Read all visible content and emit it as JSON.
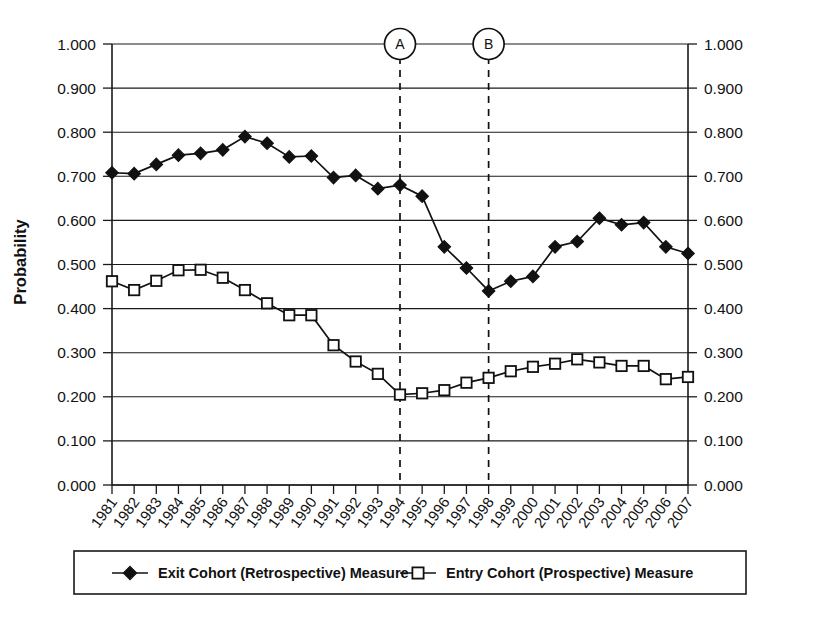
{
  "chart_data": {
    "type": "line",
    "title": "",
    "xlabel": "",
    "ylabel": "Probability",
    "ylim": [
      0.0,
      1.0
    ],
    "ytick_step": 0.1,
    "grid": true,
    "legend_position": "bottom",
    "dual_y_axis": true,
    "x": [
      1981,
      1982,
      1983,
      1984,
      1985,
      1986,
      1987,
      1988,
      1989,
      1990,
      1991,
      1992,
      1993,
      1994,
      1995,
      1996,
      1997,
      1998,
      1999,
      2000,
      2001,
      2002,
      2003,
      2004,
      2005,
      2006,
      2007
    ],
    "categories": [
      "1981",
      "1982",
      "1983",
      "1984",
      "1985",
      "1986",
      "1987",
      "1988",
      "1989",
      "1990",
      "1991",
      "1992",
      "1993",
      "1994",
      "1995",
      "1996",
      "1997",
      "1998",
      "1999",
      "2000",
      "2001",
      "2002",
      "2003",
      "2004",
      "2005",
      "2006",
      "2007"
    ],
    "ytick_labels": [
      "1.000",
      "0.900",
      "0.800",
      "0.700",
      "0.600",
      "0.500",
      "0.400",
      "0.300",
      "0.200",
      "0.100",
      "0.000"
    ],
    "ytick_values": [
      1.0,
      0.9,
      0.8,
      0.7,
      0.6,
      0.5,
      0.4,
      0.3,
      0.2,
      0.1,
      0.0
    ],
    "series": [
      {
        "name": "Exit Cohort (Retrospective) Measure",
        "marker": "filled-diamond",
        "values": [
          0.708,
          0.706,
          0.727,
          0.748,
          0.752,
          0.76,
          0.79,
          0.775,
          0.744,
          0.746,
          0.697,
          0.702,
          0.672,
          0.68,
          0.655,
          0.54,
          0.492,
          0.44,
          0.462,
          0.473,
          0.54,
          0.552,
          0.605,
          0.59,
          0.595,
          0.54,
          0.525
        ]
      },
      {
        "name": "Entry Cohort (Prospective) Measure",
        "marker": "open-square",
        "values": [
          0.462,
          0.442,
          0.463,
          0.487,
          0.488,
          0.47,
          0.442,
          0.412,
          0.385,
          0.385,
          0.317,
          0.28,
          0.252,
          0.205,
          0.208,
          0.215,
          0.232,
          0.243,
          0.258,
          0.268,
          0.275,
          0.285,
          0.278,
          0.27,
          0.27,
          0.24,
          0.245
        ]
      }
    ],
    "annotations": [
      {
        "label": "A",
        "x": 1994,
        "type": "vertical-dashed-line-with-circle-marker"
      },
      {
        "label": "B",
        "x": 1998,
        "type": "vertical-dashed-line-with-circle-marker"
      }
    ]
  },
  "legend": {
    "entries": [
      {
        "label": "Exit Cohort (Retrospective) Measure",
        "marker": "filled-diamond"
      },
      {
        "label": "Entry Cohort (Prospective) Measure",
        "marker": "open-square"
      }
    ]
  },
  "colors": {
    "foreground": "#111111",
    "background": "#ffffff",
    "gridline": "#1a1a1a"
  }
}
